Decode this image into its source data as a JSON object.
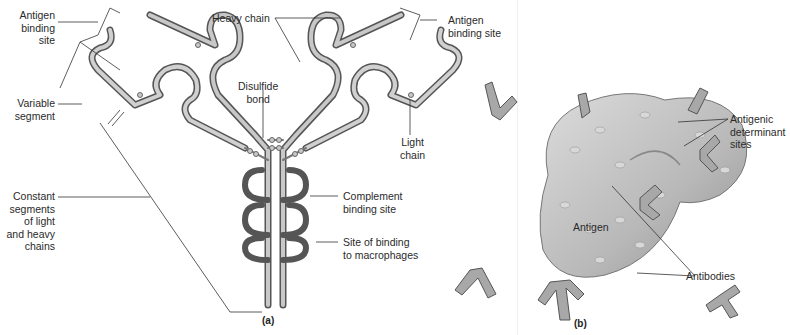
{
  "panel_a": {
    "label": "(a)",
    "labels": {
      "antigen_binding_site_left": "Antigen\nbinding\nsite",
      "variable_segment": "Variable\nsegment",
      "constant_segments": "Constant\nsegments\nof light\nand heavy\nchains",
      "heavy_chain": "Heavy chain",
      "disulfide_bond": "Disulfide\nbond",
      "antigen_binding_site_right": "Antigen\nbinding site",
      "light_chain": "Light\nchain",
      "complement_binding_site": "Complement\nbinding site",
      "macrophage_binding_site": "Site of binding\nto macrophages"
    }
  },
  "panel_b": {
    "label": "(b)",
    "labels": {
      "antigenic_determinant_sites": "Antigenic\ndeterminant\nsites",
      "antigen": "Antigen",
      "antibodies": "Antibodies"
    }
  },
  "colors": {
    "chain_fill": "#b5b5b5",
    "chain_stroke": "#5a5a5a",
    "antigen_fill": "#c4c4c4",
    "leader_line": "#333333"
  }
}
